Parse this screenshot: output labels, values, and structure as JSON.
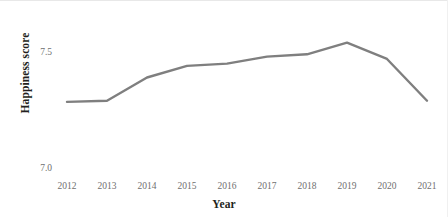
{
  "chart_data": {
    "type": "line",
    "title": "",
    "xlabel": "Year",
    "ylabel": "Happiness score",
    "categories": [
      "2012",
      "2013",
      "2014",
      "2015",
      "2016",
      "2017",
      "2018",
      "2019",
      "2020",
      "2021"
    ],
    "x": [
      2012,
      2013,
      2014,
      2015,
      2016,
      2017,
      2018,
      2019,
      2020,
      2021
    ],
    "values": [
      7.285,
      7.29,
      7.39,
      7.44,
      7.45,
      7.48,
      7.49,
      7.54,
      7.47,
      7.29
    ],
    "series": [
      {
        "name": "Happiness score",
        "values": [
          7.285,
          7.29,
          7.39,
          7.44,
          7.45,
          7.48,
          7.49,
          7.54,
          7.47,
          7.29
        ],
        "color": "#7f7f7f"
      }
    ],
    "ylim": [
      7.0,
      7.6
    ],
    "yticks": [
      7.5,
      7.0
    ],
    "ytick_labels": [
      "7.5",
      "7.0"
    ],
    "xticks": [
      2012,
      2013,
      2014,
      2015,
      2016,
      2017,
      2018,
      2019,
      2020,
      2021
    ],
    "grid": false,
    "legend": false,
    "legend_position": "none",
    "line_color": "#7f7f7f",
    "line_width": 2.4,
    "markers": false,
    "background_color": "#ffffff",
    "tick_label_color": "#6f6f6f",
    "axis_title_color": "#231f20"
  },
  "axes": {
    "y_title": "Happiness score",
    "x_title": "Year",
    "y_tick_top": "7.5",
    "y_tick_bottom": "7.0"
  }
}
